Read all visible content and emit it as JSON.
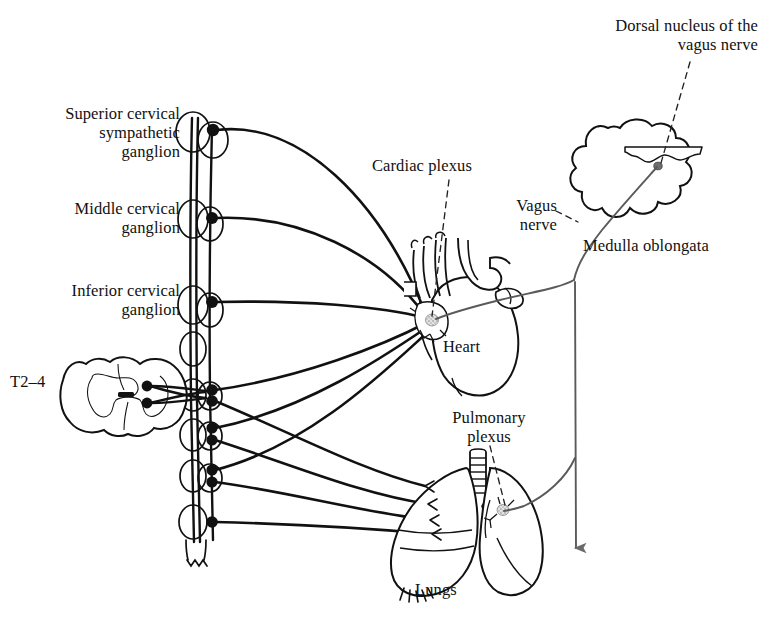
{
  "figure": {
    "background_color": "#ffffff",
    "ink_color": "#111111",
    "sympathetic_fiber_color": "#111111",
    "vagus_fiber_color": "#5a5a5a"
  },
  "labels": {
    "superior_cervical_ganglion": "Superior cervical\nsympathetic\nganglion",
    "middle_cervical_ganglion": "Middle cervical\nganglion",
    "inferior_cervical_ganglion": "Inferior cervical\nganglion",
    "spinal_segments": "T2–4",
    "cardiac_plexus": "Cardiac plexus",
    "vagus_nerve": "Vagus\nnerve",
    "dorsal_nucleus": "Dorsal nucleus of the\nvagus nerve",
    "medulla_oblongata": "Medulla oblongata",
    "heart": "Heart",
    "pulmonary_plexus": "Pulmonary\nplexus",
    "lungs": "Lungs"
  },
  "structures": {
    "sympathetic_chain": {
      "name": "sympathetic trunk",
      "ganglion_count": 10,
      "ganglion_dot_positions_y": [
        130,
        218,
        302,
        390,
        401,
        428,
        440,
        470,
        482,
        522
      ]
    },
    "spinal_cord": {
      "name": "spinal cord cross-section",
      "segment_label": "T2–4",
      "root_dot_count": 2
    },
    "medulla": {
      "name": "medulla oblongata",
      "nucleus_dot": true
    },
    "heart": {
      "name": "heart with great vessels",
      "plexus_node": true
    },
    "lungs": {
      "name": "lungs with trachea and bronchi",
      "plexus_node": true
    },
    "descending_vagus_arrow": {
      "name": "vagus nerve descending arrow",
      "direction": "down"
    }
  }
}
